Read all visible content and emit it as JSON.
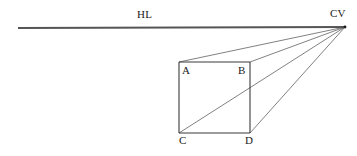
{
  "canvas": {
    "width": 357,
    "height": 156,
    "background_color": "#ffffff"
  },
  "style": {
    "line_color": "#3a3a3a",
    "horizon_color": "#555555",
    "ray_color": "#4a4a4a",
    "text_color": "#1a1a1a",
    "square_stroke_width": 1.1,
    "horizon_stroke_width": 2.0,
    "ray_stroke_width": 0.7
  },
  "labels": {
    "horizon_line": "HL",
    "center_of_vision": "CV",
    "corner_a": "A",
    "corner_b": "B",
    "corner_c": "C",
    "corner_d": "D"
  },
  "chart_data": {
    "type": "diagram",
    "points": {
      "CV": {
        "x": 345,
        "y": 27
      },
      "HL_left": {
        "x": 18,
        "y": 28
      },
      "HL_right": {
        "x": 345,
        "y": 27
      },
      "A": {
        "x": 179,
        "y": 62
      },
      "B": {
        "x": 250,
        "y": 62
      },
      "C": {
        "x": 179,
        "y": 133
      },
      "D": {
        "x": 250,
        "y": 133
      }
    },
    "segments": [
      {
        "name": "horizon-line",
        "from": "HL_left",
        "to": "HL_right",
        "kind": "horizon"
      },
      {
        "name": "square-top",
        "from": "A",
        "to": "B",
        "kind": "square"
      },
      {
        "name": "square-right",
        "from": "B",
        "to": "D",
        "kind": "square"
      },
      {
        "name": "square-bottom",
        "from": "C",
        "to": "D",
        "kind": "square"
      },
      {
        "name": "square-left",
        "from": "A",
        "to": "C",
        "kind": "square"
      },
      {
        "name": "ray-a-cv",
        "from": "A",
        "to": "CV",
        "kind": "ray"
      },
      {
        "name": "ray-b-cv",
        "from": "B",
        "to": "CV",
        "kind": "ray"
      },
      {
        "name": "ray-c-cv",
        "from": "C",
        "to": "CV",
        "kind": "ray"
      },
      {
        "name": "ray-d-cv",
        "from": "D",
        "to": "CV",
        "kind": "ray"
      }
    ]
  }
}
